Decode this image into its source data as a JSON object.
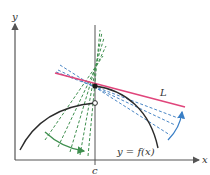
{
  "diagram": {
    "type": "calculus-tangent-limit",
    "axes": {
      "x_label": "x",
      "y_label": "y"
    },
    "point_label": "c",
    "curve_label": "y = f(x)",
    "tangent_label": "L",
    "colors": {
      "axis": "#555555",
      "curve": "#2b2b2b",
      "tangent": "#e0457b",
      "secants_right": "#4a86c5",
      "secants_left": "#3f8f4f",
      "arrow_right": "#3a7fc6",
      "arrow_left": "#3f8f4f"
    },
    "points": {
      "filled_dot": {
        "x": 95,
        "y": 86
      },
      "open_dot": {
        "x": 95,
        "y": 103
      }
    }
  }
}
